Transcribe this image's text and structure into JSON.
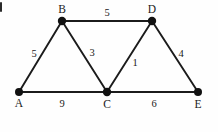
{
  "diagram": {
    "background_color": "#fefefe",
    "line_color": "#1b1b1b",
    "node_color": "#111111",
    "text_color": "#1a1a1a",
    "corner_mark": "partial-cropped-glyph",
    "nodes": [
      {
        "id": "A",
        "label": "A",
        "x": 19,
        "y": 92,
        "label_x": 19,
        "label_y": 107
      },
      {
        "id": "B",
        "label": "B",
        "x": 62,
        "y": 21,
        "label_x": 62,
        "label_y": 13
      },
      {
        "id": "C",
        "label": "C",
        "x": 107,
        "y": 92,
        "label_x": 107,
        "label_y": 108
      },
      {
        "id": "D",
        "label": "D",
        "x": 152,
        "y": 21,
        "label_x": 152,
        "label_y": 13
      },
      {
        "id": "E",
        "label": "E",
        "x": 198,
        "y": 92,
        "label_x": 198,
        "label_y": 108
      }
    ],
    "edges": [
      {
        "id": "AB",
        "from": "A",
        "to": "B",
        "weight": "5",
        "label_x": 34,
        "label_y": 57
      },
      {
        "id": "BD",
        "from": "B",
        "to": "D",
        "weight": "5",
        "label_x": 107,
        "label_y": 16
      },
      {
        "id": "BC",
        "from": "B",
        "to": "C",
        "weight": "3",
        "label_x": 92,
        "label_y": 56
      },
      {
        "id": "CD",
        "from": "C",
        "to": "D",
        "weight": "1",
        "label_x": 135,
        "label_y": 66
      },
      {
        "id": "DE",
        "from": "D",
        "to": "E",
        "weight": "4",
        "label_x": 181,
        "label_y": 57
      },
      {
        "id": "AC",
        "from": "A",
        "to": "C",
        "weight": "9",
        "label_x": 62,
        "label_y": 107
      },
      {
        "id": "CE",
        "from": "C",
        "to": "E",
        "weight": "6",
        "label_x": 154,
        "label_y": 107
      }
    ]
  }
}
